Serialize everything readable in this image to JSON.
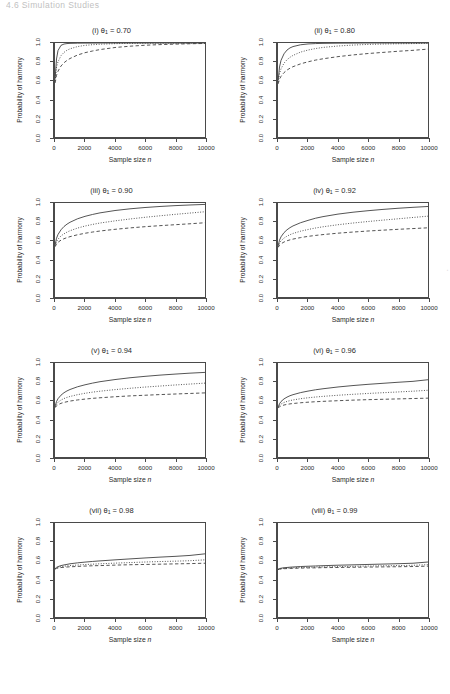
{
  "page": {
    "running_header": "4.6  Simulation Studies",
    "watermark": "."
  },
  "axes": {
    "xlabel_text": "Sample size ",
    "xlabel_italic": "n",
    "ylabel": "Probability of harmony",
    "x_ticks": [
      0,
      2000,
      4000,
      6000,
      8000,
      10000
    ],
    "x_tick_labels": [
      "0",
      "2000",
      "4000",
      "6000",
      "8000",
      "10000"
    ],
    "y_ticks": [
      0.0,
      0.2,
      0.4,
      0.6,
      0.8,
      1.0
    ],
    "y_tick_labels": [
      "0.0",
      "0.2",
      "0.4",
      "0.6",
      "0.8",
      "1.0"
    ],
    "xlim": [
      0,
      10000
    ],
    "ylim": [
      0.0,
      1.0
    ]
  },
  "chart_data": [
    {
      "id": "panel-i",
      "type": "line",
      "title_index": "(i)",
      "title_param": "θ",
      "title_sub": "1",
      "title_value": "0.70",
      "title": "(i) θ1 = 0.70",
      "xlabel": "Sample size n",
      "ylabel": "Probability of harmony",
      "xlim": [
        0,
        10000
      ],
      "ylim": [
        0.0,
        1.0
      ],
      "grid": false,
      "legend": "none",
      "x": [
        10,
        100,
        200,
        400,
        600,
        800,
        1000,
        1500,
        2000,
        2500,
        3000,
        4000,
        5000,
        6000,
        7000,
        8000,
        9000,
        10000
      ],
      "series": [
        {
          "name": "solid",
          "style": "solid",
          "values": [
            0.62,
            0.83,
            0.92,
            0.975,
            0.989,
            0.994,
            0.996,
            0.998,
            0.999,
            0.999,
            1.0,
            1.0,
            1.0,
            1.0,
            1.0,
            1.0,
            1.0,
            1.0
          ]
        },
        {
          "name": "dotted",
          "style": "dotted",
          "values": [
            0.6,
            0.745,
            0.8,
            0.865,
            0.9,
            0.923,
            0.938,
            0.962,
            0.975,
            0.982,
            0.987,
            0.993,
            0.996,
            0.998,
            0.999,
            0.999,
            1.0,
            1.0
          ]
        },
        {
          "name": "dashed",
          "style": "dashed",
          "values": [
            0.575,
            0.655,
            0.7,
            0.755,
            0.79,
            0.815,
            0.835,
            0.872,
            0.897,
            0.915,
            0.93,
            0.952,
            0.966,
            0.976,
            0.983,
            0.988,
            0.992,
            0.995
          ]
        }
      ]
    },
    {
      "id": "panel-ii",
      "type": "line",
      "title_index": "(ii)",
      "title_param": "θ",
      "title_sub": "1",
      "title_value": "0.80",
      "title": "(ii) θ1 = 0.80",
      "xlabel": "Sample size n",
      "ylabel": "Probability of harmony",
      "xlim": [
        0,
        10000
      ],
      "ylim": [
        0.0,
        1.0
      ],
      "grid": false,
      "legend": "none",
      "x": [
        10,
        100,
        200,
        400,
        600,
        800,
        1000,
        1500,
        2000,
        2500,
        3000,
        4000,
        5000,
        6000,
        7000,
        8000,
        9000,
        10000
      ],
      "series": [
        {
          "name": "solid",
          "style": "solid",
          "values": [
            0.6,
            0.745,
            0.815,
            0.885,
            0.925,
            0.948,
            0.962,
            0.981,
            0.99,
            0.994,
            0.996,
            0.998,
            0.999,
            1.0,
            1.0,
            1.0,
            1.0,
            1.0
          ]
        },
        {
          "name": "dotted",
          "style": "dotted",
          "values": [
            0.585,
            0.675,
            0.725,
            0.785,
            0.822,
            0.848,
            0.868,
            0.903,
            0.925,
            0.941,
            0.953,
            0.968,
            0.978,
            0.985,
            0.989,
            0.992,
            0.994,
            0.996
          ]
        },
        {
          "name": "dashed",
          "style": "dashed",
          "values": [
            0.565,
            0.615,
            0.645,
            0.685,
            0.712,
            0.732,
            0.748,
            0.778,
            0.8,
            0.818,
            0.832,
            0.855,
            0.873,
            0.888,
            0.9,
            0.912,
            0.922,
            0.935
          ]
        }
      ]
    },
    {
      "id": "panel-iii",
      "type": "line",
      "title_index": "(iii)",
      "title_param": "θ",
      "title_sub": "1",
      "title_value": "0.90",
      "title": "(iii) θ1 = 0.90",
      "xlabel": "Sample size n",
      "ylabel": "Probability of harmony",
      "xlim": [
        0,
        10000
      ],
      "ylim": [
        0.0,
        1.0
      ],
      "grid": false,
      "legend": "none",
      "x": [
        10,
        100,
        200,
        400,
        600,
        800,
        1000,
        1500,
        2000,
        2500,
        3000,
        4000,
        5000,
        6000,
        7000,
        8000,
        9000,
        10000
      ],
      "series": [
        {
          "name": "solid",
          "style": "solid",
          "values": [
            0.555,
            0.625,
            0.665,
            0.715,
            0.75,
            0.775,
            0.795,
            0.832,
            0.858,
            0.878,
            0.895,
            0.92,
            0.938,
            0.952,
            0.963,
            0.972,
            0.979,
            0.985
          ]
        },
        {
          "name": "dotted",
          "style": "dotted",
          "values": [
            0.545,
            0.59,
            0.615,
            0.65,
            0.672,
            0.69,
            0.705,
            0.733,
            0.755,
            0.772,
            0.787,
            0.81,
            0.83,
            0.848,
            0.864,
            0.879,
            0.893,
            0.907
          ]
        },
        {
          "name": "dashed",
          "style": "dashed",
          "values": [
            0.535,
            0.565,
            0.582,
            0.605,
            0.62,
            0.632,
            0.642,
            0.662,
            0.678,
            0.691,
            0.702,
            0.72,
            0.735,
            0.748,
            0.759,
            0.769,
            0.779,
            0.79
          ]
        }
      ]
    },
    {
      "id": "panel-iv",
      "type": "line",
      "title_index": "(iv)",
      "title_param": "θ",
      "title_sub": "1",
      "title_value": "0.92",
      "title": "(iv) θ1 = 0.92",
      "xlabel": "Sample size n",
      "ylabel": "Probability of harmony",
      "xlim": [
        0,
        10000
      ],
      "ylim": [
        0.0,
        1.0
      ],
      "grid": false,
      "legend": "none",
      "x": [
        10,
        100,
        200,
        400,
        600,
        800,
        1000,
        1500,
        2000,
        2500,
        3000,
        4000,
        5000,
        6000,
        7000,
        8000,
        9000,
        10000
      ],
      "series": [
        {
          "name": "solid",
          "style": "solid",
          "values": [
            0.545,
            0.605,
            0.64,
            0.685,
            0.715,
            0.738,
            0.756,
            0.79,
            0.815,
            0.838,
            0.855,
            0.882,
            0.902,
            0.918,
            0.932,
            0.944,
            0.954,
            0.963
          ]
        },
        {
          "name": "dotted",
          "style": "dotted",
          "values": [
            0.535,
            0.575,
            0.597,
            0.627,
            0.647,
            0.663,
            0.676,
            0.7,
            0.718,
            0.734,
            0.747,
            0.769,
            0.787,
            0.803,
            0.818,
            0.832,
            0.846,
            0.86
          ]
        },
        {
          "name": "dashed",
          "style": "dashed",
          "values": [
            0.528,
            0.552,
            0.566,
            0.585,
            0.598,
            0.608,
            0.616,
            0.632,
            0.645,
            0.655,
            0.664,
            0.679,
            0.691,
            0.702,
            0.711,
            0.72,
            0.728,
            0.736
          ]
        }
      ]
    },
    {
      "id": "panel-v",
      "type": "line",
      "title_index": "(v)",
      "title_param": "θ",
      "title_sub": "1",
      "title_value": "0.94",
      "title": "(v) θ1 = 0.94",
      "xlabel": "Sample size n",
      "ylabel": "Probability of harmony",
      "xlim": [
        0,
        10000
      ],
      "ylim": [
        0.0,
        1.0
      ],
      "grid": false,
      "legend": "none",
      "x": [
        10,
        100,
        200,
        400,
        600,
        800,
        1000,
        1500,
        2000,
        2500,
        3000,
        4000,
        5000,
        6000,
        7000,
        8000,
        9000,
        10000
      ],
      "series": [
        {
          "name": "solid",
          "style": "solid",
          "values": [
            0.54,
            0.59,
            0.62,
            0.658,
            0.684,
            0.703,
            0.718,
            0.747,
            0.768,
            0.786,
            0.801,
            0.824,
            0.843,
            0.858,
            0.871,
            0.882,
            0.892,
            0.9
          ]
        },
        {
          "name": "dotted",
          "style": "dotted",
          "values": [
            0.532,
            0.565,
            0.583,
            0.606,
            0.622,
            0.634,
            0.644,
            0.663,
            0.678,
            0.69,
            0.7,
            0.717,
            0.731,
            0.744,
            0.755,
            0.766,
            0.776,
            0.786
          ]
        },
        {
          "name": "dashed",
          "style": "dashed",
          "values": [
            0.525,
            0.545,
            0.556,
            0.571,
            0.581,
            0.588,
            0.595,
            0.607,
            0.616,
            0.624,
            0.63,
            0.641,
            0.65,
            0.657,
            0.664,
            0.67,
            0.676,
            0.682
          ]
        }
      ]
    },
    {
      "id": "panel-vi",
      "type": "line",
      "title_index": "(vi)",
      "title_param": "θ",
      "title_sub": "1",
      "title_value": "0.96",
      "title": "(vi) θ1 = 0.96",
      "xlabel": "Sample size n",
      "ylabel": "Probability of harmony",
      "xlim": [
        0,
        10000
      ],
      "ylim": [
        0.0,
        1.0
      ],
      "grid": false,
      "legend": "none",
      "x": [
        10,
        100,
        200,
        400,
        600,
        800,
        1000,
        1500,
        2000,
        2500,
        3000,
        4000,
        5000,
        6000,
        7000,
        8000,
        9000,
        10000
      ],
      "series": [
        {
          "name": "solid",
          "style": "solid",
          "values": [
            0.53,
            0.567,
            0.59,
            0.618,
            0.637,
            0.652,
            0.663,
            0.685,
            0.701,
            0.715,
            0.726,
            0.745,
            0.76,
            0.773,
            0.784,
            0.795,
            0.805,
            0.822
          ]
        },
        {
          "name": "dotted",
          "style": "dotted",
          "values": [
            0.525,
            0.551,
            0.563,
            0.58,
            0.591,
            0.6,
            0.607,
            0.62,
            0.63,
            0.638,
            0.645,
            0.657,
            0.667,
            0.676,
            0.684,
            0.692,
            0.7,
            0.71
          ]
        },
        {
          "name": "dashed",
          "style": "dashed",
          "values": [
            0.52,
            0.535,
            0.543,
            0.553,
            0.56,
            0.565,
            0.569,
            0.577,
            0.583,
            0.588,
            0.592,
            0.599,
            0.605,
            0.61,
            0.614,
            0.618,
            0.622,
            0.626
          ]
        }
      ]
    },
    {
      "id": "panel-vii",
      "type": "line",
      "title_index": "(vii)",
      "title_param": "θ",
      "title_sub": "1",
      "title_value": "0.98",
      "title": "(vii) θ1 = 0.98",
      "xlabel": "Sample size n",
      "ylabel": "Probability of harmony",
      "xlim": [
        0,
        10000
      ],
      "ylim": [
        0.0,
        1.0
      ],
      "grid": false,
      "legend": "none",
      "x": [
        10,
        100,
        200,
        400,
        600,
        800,
        1000,
        1500,
        2000,
        2500,
        3000,
        4000,
        5000,
        6000,
        7000,
        8000,
        9000,
        10000
      ],
      "series": [
        {
          "name": "solid",
          "style": "solid",
          "values": [
            0.515,
            0.528,
            0.536,
            0.547,
            0.554,
            0.56,
            0.566,
            0.576,
            0.584,
            0.591,
            0.597,
            0.608,
            0.618,
            0.628,
            0.637,
            0.645,
            0.655,
            0.672
          ]
        },
        {
          "name": "dotted",
          "style": "dotted",
          "values": [
            0.512,
            0.522,
            0.528,
            0.535,
            0.54,
            0.544,
            0.547,
            0.553,
            0.558,
            0.562,
            0.566,
            0.573,
            0.579,
            0.585,
            0.59,
            0.594,
            0.599,
            0.608
          ]
        },
        {
          "name": "dashed",
          "style": "dashed",
          "values": [
            0.51,
            0.517,
            0.521,
            0.526,
            0.529,
            0.532,
            0.534,
            0.538,
            0.542,
            0.545,
            0.547,
            0.552,
            0.556,
            0.559,
            0.562,
            0.565,
            0.568,
            0.572
          ]
        }
      ]
    },
    {
      "id": "panel-viii",
      "type": "line",
      "title_index": "(viii)",
      "title_param": "θ",
      "title_sub": "1",
      "title_value": "0.99",
      "title": "(viii) θ1 = 0.99",
      "xlabel": "Sample size n",
      "ylabel": "Probability of harmony",
      "xlim": [
        0,
        10000
      ],
      "ylim": [
        0.0,
        1.0
      ],
      "grid": false,
      "legend": "none",
      "x": [
        10,
        100,
        200,
        400,
        600,
        800,
        1000,
        1500,
        2000,
        2500,
        3000,
        4000,
        5000,
        6000,
        7000,
        8000,
        9000,
        10000
      ],
      "series": [
        {
          "name": "solid",
          "style": "solid",
          "values": [
            0.508,
            0.515,
            0.519,
            0.524,
            0.527,
            0.53,
            0.532,
            0.537,
            0.54,
            0.543,
            0.546,
            0.551,
            0.555,
            0.559,
            0.563,
            0.567,
            0.572,
            0.585
          ]
        },
        {
          "name": "dotted",
          "style": "dotted",
          "values": [
            0.506,
            0.511,
            0.514,
            0.518,
            0.52,
            0.522,
            0.523,
            0.526,
            0.529,
            0.531,
            0.533,
            0.536,
            0.539,
            0.542,
            0.545,
            0.547,
            0.55,
            0.557
          ]
        },
        {
          "name": "dashed",
          "style": "dashed",
          "values": [
            0.505,
            0.509,
            0.511,
            0.514,
            0.515,
            0.517,
            0.518,
            0.52,
            0.522,
            0.523,
            0.525,
            0.527,
            0.529,
            0.531,
            0.533,
            0.535,
            0.537,
            0.541
          ]
        }
      ]
    }
  ]
}
